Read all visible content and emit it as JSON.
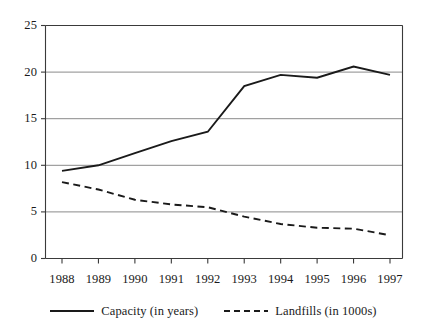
{
  "chart_data": {
    "type": "line",
    "title": "",
    "subtitle": "",
    "xlabel": "",
    "ylabel": "",
    "categories": [
      "1988",
      "1989",
      "1990",
      "1991",
      "1992",
      "1993",
      "1994",
      "1995",
      "1996",
      "1997"
    ],
    "series": [
      {
        "name": "Capacity (in years)",
        "style": "solid",
        "color": "#1a1a1a",
        "values": [
          9.4,
          10.0,
          11.3,
          12.6,
          13.6,
          18.5,
          19.7,
          19.4,
          20.6,
          19.7
        ]
      },
      {
        "name": "Landfills (in 1000s)",
        "style": "dashed",
        "color": "#1a1a1a",
        "values": [
          8.2,
          7.4,
          6.3,
          5.8,
          5.5,
          4.5,
          3.7,
          3.3,
          3.2,
          2.5
        ]
      }
    ],
    "ylim": [
      0,
      25
    ],
    "yticks": [
      0,
      5,
      10,
      15,
      20,
      25
    ],
    "ytick_labels": [
      "0",
      "5",
      "10",
      "15",
      "20",
      "25"
    ],
    "xtick_labels": [
      "1988",
      "1989",
      "1990",
      "1991",
      "1992",
      "1993",
      "1994",
      "1995",
      "1996",
      "1997"
    ],
    "grid": "horizontal",
    "grid_color": "#8a8a8a",
    "axis_color": "#3a3a3a",
    "plot_background": "#ffffff",
    "legend_position": "bottom-center",
    "legend": [
      {
        "label": "Capacity (in years)",
        "style": "solid"
      },
      {
        "label": "Landfills (in 1000s)",
        "style": "dashed"
      }
    ]
  }
}
